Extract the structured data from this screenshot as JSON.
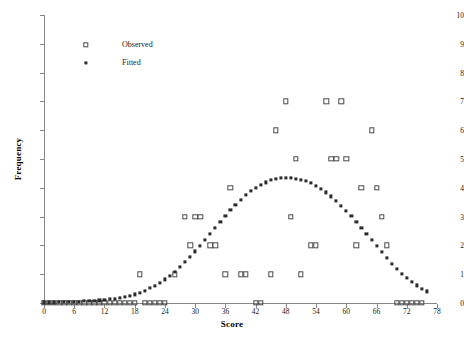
{
  "chart_data": {
    "type": "scatter",
    "title": "",
    "xlabel": "Score",
    "ylabel": "Frequency",
    "xlim": [
      0,
      78
    ],
    "ylim": [
      0,
      10
    ],
    "xticks": [
      0,
      6,
      12,
      18,
      24,
      30,
      36,
      42,
      48,
      54,
      60,
      66,
      72,
      78
    ],
    "yticks": [
      0,
      1,
      2,
      3,
      4,
      5,
      6,
      7,
      8,
      9,
      10
    ],
    "grid": false,
    "legend_position": "top-left",
    "series": [
      {
        "name": "Observed",
        "marker": "open-square",
        "color": "#4a4a4a",
        "points": [
          [
            0,
            0
          ],
          [
            1,
            0
          ],
          [
            2,
            0
          ],
          [
            3,
            0
          ],
          [
            4,
            0
          ],
          [
            5,
            0
          ],
          [
            6,
            0
          ],
          [
            7,
            0
          ],
          [
            8,
            0
          ],
          [
            9,
            0
          ],
          [
            10,
            0
          ],
          [
            11,
            0
          ],
          [
            12,
            0
          ],
          [
            13,
            0
          ],
          [
            14,
            0
          ],
          [
            15,
            0
          ],
          [
            16,
            0
          ],
          [
            17,
            0
          ],
          [
            18,
            0
          ],
          [
            19,
            1
          ],
          [
            20,
            0
          ],
          [
            21,
            0
          ],
          [
            22,
            0
          ],
          [
            23,
            0
          ],
          [
            24,
            0
          ],
          [
            26,
            1
          ],
          [
            28,
            3
          ],
          [
            29,
            2
          ],
          [
            30,
            3
          ],
          [
            31,
            3
          ],
          [
            33,
            2
          ],
          [
            34,
            2
          ],
          [
            36,
            1
          ],
          [
            37,
            4
          ],
          [
            39,
            1
          ],
          [
            40,
            1
          ],
          [
            42,
            0
          ],
          [
            43,
            0
          ],
          [
            45,
            1
          ],
          [
            46,
            6
          ],
          [
            48,
            7
          ],
          [
            49,
            3
          ],
          [
            50,
            5
          ],
          [
            51,
            1
          ],
          [
            53,
            2
          ],
          [
            54,
            2
          ],
          [
            56,
            7
          ],
          [
            57,
            5
          ],
          [
            58,
            5
          ],
          [
            59,
            7
          ],
          [
            60,
            5
          ],
          [
            62,
            2
          ],
          [
            63,
            4
          ],
          [
            65,
            6
          ],
          [
            66,
            4
          ],
          [
            67,
            3
          ],
          [
            68,
            2
          ],
          [
            70,
            0
          ],
          [
            71,
            0
          ],
          [
            72,
            0
          ],
          [
            73,
            0
          ],
          [
            74,
            0
          ],
          [
            75,
            0
          ]
        ]
      },
      {
        "name": "Fitted",
        "marker": "filled-square",
        "color": "#2b2b2b",
        "points": [
          [
            0,
            0.02
          ],
          [
            1,
            0.02
          ],
          [
            2,
            0.02
          ],
          [
            3,
            0.03
          ],
          [
            4,
            0.03
          ],
          [
            5,
            0.04
          ],
          [
            6,
            0.04
          ],
          [
            7,
            0.05
          ],
          [
            8,
            0.06
          ],
          [
            9,
            0.07
          ],
          [
            10,
            0.08
          ],
          [
            11,
            0.09
          ],
          [
            12,
            0.11
          ],
          [
            13,
            0.13
          ],
          [
            14,
            0.15
          ],
          [
            15,
            0.18
          ],
          [
            16,
            0.21
          ],
          [
            17,
            0.25
          ],
          [
            18,
            0.3
          ],
          [
            19,
            0.36
          ],
          [
            20,
            0.43
          ],
          [
            21,
            0.51
          ],
          [
            22,
            0.6
          ],
          [
            23,
            0.7
          ],
          [
            24,
            0.82
          ],
          [
            25,
            0.95
          ],
          [
            26,
            1.09
          ],
          [
            27,
            1.25
          ],
          [
            28,
            1.42
          ],
          [
            29,
            1.6
          ],
          [
            30,
            1.79
          ],
          [
            31,
            1.99
          ],
          [
            32,
            2.19
          ],
          [
            33,
            2.4
          ],
          [
            34,
            2.61
          ],
          [
            35,
            2.82
          ],
          [
            36,
            3.02
          ],
          [
            37,
            3.22
          ],
          [
            38,
            3.41
          ],
          [
            39,
            3.58
          ],
          [
            40,
            3.74
          ],
          [
            41,
            3.88
          ],
          [
            42,
            4.0
          ],
          [
            43,
            4.11
          ],
          [
            44,
            4.19
          ],
          [
            45,
            4.26
          ],
          [
            46,
            4.3
          ],
          [
            47,
            4.33
          ],
          [
            48,
            4.34
          ],
          [
            49,
            4.34
          ],
          [
            50,
            4.32
          ],
          [
            51,
            4.28
          ],
          [
            52,
            4.23
          ],
          [
            53,
            4.16
          ],
          [
            54,
            4.07
          ],
          [
            55,
            3.96
          ],
          [
            56,
            3.84
          ],
          [
            57,
            3.7
          ],
          [
            58,
            3.55
          ],
          [
            59,
            3.38
          ],
          [
            60,
            3.2
          ],
          [
            61,
            3.01
          ],
          [
            62,
            2.81
          ],
          [
            63,
            2.6
          ],
          [
            64,
            2.39
          ],
          [
            65,
            2.18
          ],
          [
            66,
            1.97
          ],
          [
            67,
            1.76
          ],
          [
            68,
            1.56
          ],
          [
            69,
            1.37
          ],
          [
            70,
            1.19
          ],
          [
            71,
            1.02
          ],
          [
            72,
            0.87
          ],
          [
            73,
            0.73
          ],
          [
            74,
            0.61
          ],
          [
            75,
            0.5
          ],
          [
            76,
            0.4
          ]
        ]
      }
    ]
  },
  "legend": {
    "items": [
      {
        "label": "Observed",
        "marker": "open-square"
      },
      {
        "label": "Fitted",
        "marker": "filled-square"
      }
    ]
  }
}
